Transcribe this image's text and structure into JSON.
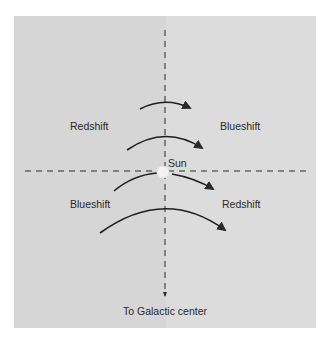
{
  "diagram": {
    "background_color": "#ffffff",
    "panel_color_left": "#d6d6d6",
    "panel_color_right": "#dcdcdc",
    "line_color": "#2a2a2a",
    "sun_color": "#f2f2f2",
    "labels": {
      "upper_left": "Redshift",
      "upper_right": "Blueshift",
      "lower_left": "Blueshift",
      "lower_right": "Redshift",
      "sun": "Sun",
      "galactic_center": "To Galactic center"
    },
    "arcs": [
      {
        "name": "outer-orbit-far",
        "direction": "clockwise"
      },
      {
        "name": "outer-orbit-near",
        "direction": "clockwise"
      },
      {
        "name": "inner-orbit-near",
        "direction": "clockwise"
      },
      {
        "name": "inner-orbit-far",
        "direction": "clockwise"
      }
    ]
  }
}
